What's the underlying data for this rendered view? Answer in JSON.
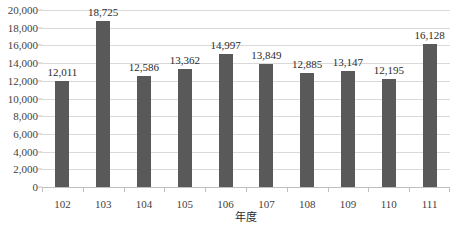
{
  "chart_data": {
    "type": "bar",
    "title": "",
    "xlabel": "年度",
    "ylabel": "",
    "categories": [
      "102",
      "103",
      "104",
      "105",
      "106",
      "107",
      "108",
      "109",
      "110",
      "111"
    ],
    "values": [
      12011,
      18725,
      12586,
      13362,
      14997,
      13849,
      12885,
      13147,
      12195,
      16128
    ],
    "data_labels": [
      "12,011",
      "18,725",
      "12,586",
      "13,362",
      "14,997",
      "13,849",
      "12,885",
      "13,147",
      "12,195",
      "16,128"
    ],
    "ylim": [
      0,
      20000
    ],
    "y_tick_values": [
      0,
      2000,
      4000,
      6000,
      8000,
      10000,
      12000,
      14000,
      16000,
      18000,
      20000
    ],
    "y_tick_labels": [
      "0",
      "2,000",
      "4,000",
      "6,000",
      "8,000",
      "10,000",
      "12,000",
      "14,000",
      "16,000",
      "18,000",
      "20,000"
    ],
    "grid": true,
    "legend": "none",
    "series_color": "#595959",
    "gridline_color": "#d9d9d9",
    "axis_color": "#bfbfbf"
  }
}
